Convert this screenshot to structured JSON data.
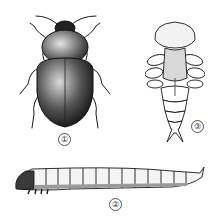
{
  "figure": {
    "items": [
      {
        "id": 1,
        "label": "①",
        "stage": "adult beetle"
      },
      {
        "id": 2,
        "label": "②",
        "stage": "larva"
      },
      {
        "id": 3,
        "label": "③",
        "stage": "pupa"
      }
    ]
  },
  "colors": {
    "ink": "#1a1a1a",
    "mid": "#6b6b6b",
    "light": "#e8e8e8",
    "background": "#ffffff"
  }
}
